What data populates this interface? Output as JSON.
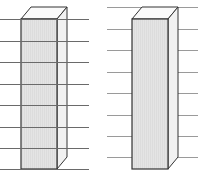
{
  "diagram": {
    "colors": {
      "background": "#ffffff",
      "front_face": "#e2e2e2",
      "side_face": "#f1f1f1",
      "top_face": "#fafafa",
      "outline": "#333333",
      "lines": "#9a9a9a",
      "lines_over_box": "#6a6a6a"
    },
    "left_box": {
      "front": {
        "x": 21,
        "y": 19,
        "width": 36,
        "height": 150
      },
      "depth": {
        "dx": 10,
        "dy": -12
      },
      "lines": {
        "x1": 0,
        "x2": 89,
        "ys": [
          19,
          41,
          62,
          84,
          105,
          127,
          148,
          169
        ],
        "over_box": true
      }
    },
    "right_box": {
      "front": {
        "x": 132,
        "y": 19,
        "width": 36,
        "height": 150
      },
      "depth": {
        "dx": 10,
        "dy": -12
      },
      "lines": {
        "x1": 107,
        "x2": 198,
        "ys": [
          7,
          29,
          50,
          72,
          93,
          115,
          136,
          157
        ],
        "over_box": false
      }
    }
  }
}
